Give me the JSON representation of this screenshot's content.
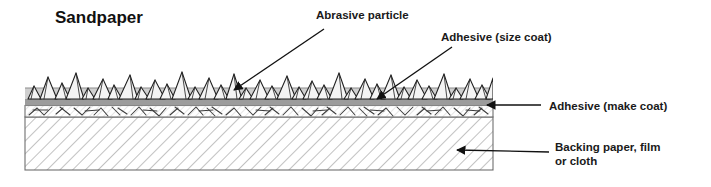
{
  "diagram": {
    "title": "Sandpaper",
    "type": "cross-section-schematic",
    "labels": {
      "abrasive_particle": "Abrasive particle",
      "adhesive_size_coat": "Adhesive (size coat)",
      "adhesive_make_coat": "Adhesive (make coat)",
      "backing_line1": "Backing paper, film",
      "backing_line2": "or cloth"
    },
    "layers": [
      {
        "name": "abrasive-particles",
        "label": "Abrasive particle",
        "description": "irregular jagged triangular grit particles protruding above the coating",
        "fill": "#f2f2f2",
        "stroke": "#222222"
      },
      {
        "name": "size-coat",
        "label": "Adhesive (size coat)",
        "description": "light grey adhesive band covering the lower part of the grit",
        "fill": "#cfcfcf",
        "stroke": "#6b6b6b"
      },
      {
        "name": "make-coat",
        "label": "Adhesive (make coat)",
        "description": "darker grey adhesive band bonding grit to backing",
        "fill": "#9c9c9c",
        "stroke": "#555555"
      },
      {
        "name": "backing-fiber-zone",
        "label": "",
        "description": "white band with random scribble/fiber hatching where adhesive penetrates the backing",
        "fill": "#ffffff",
        "stroke": "#555555"
      },
      {
        "name": "backing",
        "label": "Backing paper, film or cloth",
        "description": "thick substrate drawn with 45 degree diagonal hatch lines",
        "fill": "#ffffff",
        "stroke": "#707070"
      }
    ],
    "colors": {
      "background": "#ffffff",
      "ink": "#1a1a1a",
      "size_coat": "#cfcfcf",
      "make_coat": "#9c9c9c",
      "hatch": "#8a8a8a"
    },
    "annotations": [
      {
        "name": "arrow-abrasive-particle",
        "from": [
          324,
          29
        ],
        "to": [
          233,
          90
        ]
      },
      {
        "name": "arrow-size-coat",
        "from": [
          452,
          47
        ],
        "to": [
          376,
          99
        ]
      },
      {
        "name": "arrow-make-coat",
        "from": [
          541,
          105
        ],
        "to": [
          486,
          105
        ]
      },
      {
        "name": "arrow-backing",
        "from": [
          549,
          152
        ],
        "to": [
          456,
          150
        ]
      }
    ]
  }
}
